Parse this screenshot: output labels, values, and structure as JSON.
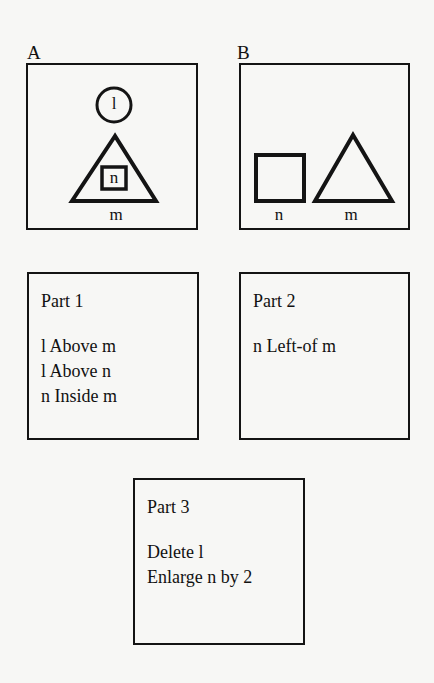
{
  "panels": {
    "a": {
      "label": "A",
      "shapes": {
        "circle": {
          "name": "l"
        },
        "triangle": {
          "name": "m"
        },
        "square": {
          "name": "n"
        }
      }
    },
    "b": {
      "label": "B",
      "shapes": {
        "square": {
          "name": "n"
        },
        "triangle": {
          "name": "m"
        }
      }
    }
  },
  "parts": [
    {
      "title": "Part 1",
      "lines": [
        "l Above m",
        "l Above n",
        "n Inside m"
      ]
    },
    {
      "title": "Part 2",
      "lines": [
        "n Left-of m"
      ]
    },
    {
      "title": "Part 3",
      "lines": [
        "Delete l",
        "Enlarge n by 2"
      ]
    }
  ],
  "colors": {
    "stroke": "#141414",
    "background": "#f7f7f5"
  }
}
